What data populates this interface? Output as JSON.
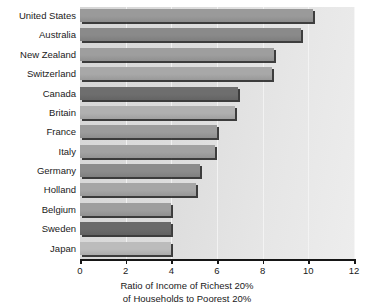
{
  "chart_data": {
    "type": "bar",
    "orientation": "horizontal",
    "title": "",
    "xlabel": "Ratio of Income of Richest 20% of Households to Poorest 20%",
    "xlabel_line1": "Ratio of Income of Richest 20%",
    "xlabel_line2": "of Households to Poorest 20%",
    "ylabel": "",
    "xlim": [
      0,
      12
    ],
    "xticks": [
      0,
      2,
      4,
      6,
      8,
      10,
      12
    ],
    "xtick_labels": [
      "0",
      "2",
      "4",
      "6",
      "8",
      "10",
      "12"
    ],
    "grid": true,
    "grid_axis": "x",
    "legend": false,
    "categories": [
      "United States",
      "Australia",
      "New Zealand",
      "Switzerland",
      "Canada",
      "Britain",
      "France",
      "Italy",
      "Germany",
      "Holland",
      "Belgium",
      "Sweden",
      "Japan"
    ],
    "values": [
      10.2,
      9.7,
      8.5,
      8.4,
      6.9,
      6.8,
      6.0,
      5.9,
      5.25,
      5.1,
      4.0,
      4.0,
      4.0
    ],
    "bar_colors": [
      "#9a9a9a",
      "#8a8a8a",
      "#9e9e9e",
      "#a8a8a8",
      "#6e6e6e",
      "#b0b0b0",
      "#9c9c9c",
      "#a2a2a2",
      "#8c8c8c",
      "#a6a6a6",
      "#9e9e9e",
      "#6a6a6a",
      "#bcbcbc"
    ],
    "plot_background": "#dedede",
    "gridline_color": "#f4f4f4",
    "axis_color": "#161616",
    "text_color": "#1a1a1a"
  }
}
